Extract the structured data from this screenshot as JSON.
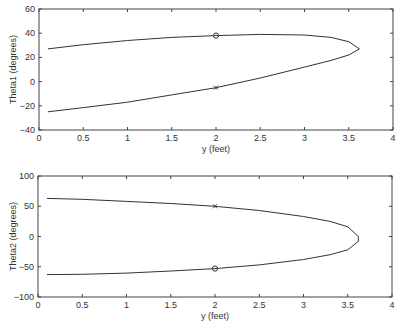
{
  "chart_data": [
    {
      "type": "line",
      "title": "",
      "xlabel": "y (feet)",
      "ylabel": "Theta1 (degrees)",
      "xlim": [
        0,
        4
      ],
      "ylim": [
        -40,
        60
      ],
      "xticks": [
        "0",
        "0.5",
        "1",
        "1.5",
        "2",
        "2.5",
        "3",
        "3.5",
        "4"
      ],
      "yticks": [
        "60",
        "40",
        "20",
        "0",
        "-20",
        "-40"
      ],
      "grid": false,
      "series": [
        {
          "name": "upper branch",
          "x": [
            0.1,
            0.5,
            1.0,
            1.5,
            2.0,
            2.5,
            3.0,
            3.3,
            3.5,
            3.62
          ],
          "y": [
            27,
            30.5,
            34,
            36.5,
            38,
            39,
            38.5,
            36.5,
            33,
            27
          ],
          "marker_at": {
            "x": 2.0,
            "y": 38,
            "symbol": "o"
          }
        },
        {
          "name": "lower branch",
          "x": [
            0.1,
            0.5,
            1.0,
            1.5,
            2.0,
            2.5,
            3.0,
            3.3,
            3.5,
            3.62
          ],
          "y": [
            -25,
            -21.5,
            -17,
            -11,
            -5,
            3,
            12,
            17.5,
            22,
            27
          ],
          "marker_at": {
            "x": 2.0,
            "y": -5,
            "symbol": "x"
          }
        }
      ]
    },
    {
      "type": "line",
      "title": "",
      "xlabel": "y (feet)",
      "ylabel": "Theta2 (degrees)",
      "xlim": [
        0,
        4
      ],
      "ylim": [
        -100,
        100
      ],
      "xticks": [
        "0",
        "0.5",
        "1",
        "1.5",
        "2",
        "2.5",
        "3",
        "3.5",
        "4"
      ],
      "yticks": [
        "100",
        "50",
        "0",
        "-50",
        "-100"
      ],
      "grid": false,
      "series": [
        {
          "name": "upper branch",
          "x": [
            0.1,
            0.5,
            1.0,
            1.5,
            2.0,
            2.5,
            3.0,
            3.3,
            3.5,
            3.62
          ],
          "y": [
            63,
            61.5,
            58,
            54.5,
            50,
            43,
            33,
            25,
            16,
            0
          ],
          "marker_at": {
            "x": 2.0,
            "y": 50,
            "symbol": "x"
          }
        },
        {
          "name": "lower branch",
          "x": [
            0.1,
            0.5,
            1.0,
            1.5,
            2.0,
            2.5,
            3.0,
            3.3,
            3.5,
            3.62
          ],
          "y": [
            -63,
            -62.5,
            -60.5,
            -57,
            -53,
            -47,
            -38,
            -30,
            -22,
            -8
          ],
          "marker_at": {
            "x": 2.0,
            "y": -53,
            "symbol": "o"
          }
        }
      ]
    }
  ]
}
